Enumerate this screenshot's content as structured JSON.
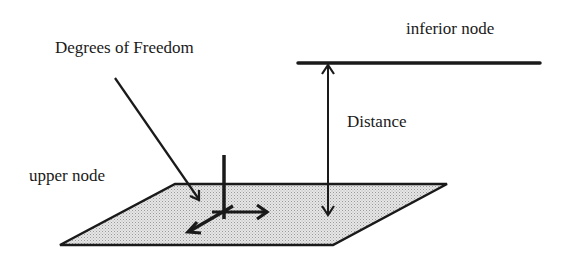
{
  "diagram": {
    "type": "node-distance-schematic",
    "labels": {
      "degrees_of_freedom": "Degrees of Freedom",
      "inferior_node": "inferior node",
      "distance": "Distance",
      "upper_node": "upper node"
    },
    "colors": {
      "stroke": "#1a1a1a",
      "plane_fill": "#d9d9d9",
      "background": "#ffffff"
    },
    "elements": [
      {
        "id": "inferior-node-line",
        "kind": "line",
        "label_ref": "inferior_node"
      },
      {
        "id": "distance-arrow",
        "kind": "double-arrow",
        "label_ref": "distance"
      },
      {
        "id": "upper-node-plane",
        "kind": "parallelogram",
        "label_ref": "upper_node"
      },
      {
        "id": "dof-axes",
        "kind": "axes-glyph",
        "label_ref": "degrees_of_freedom"
      },
      {
        "id": "dof-pointer",
        "kind": "arrow",
        "from": "degrees_of_freedom",
        "to": "dof-axes"
      }
    ]
  }
}
